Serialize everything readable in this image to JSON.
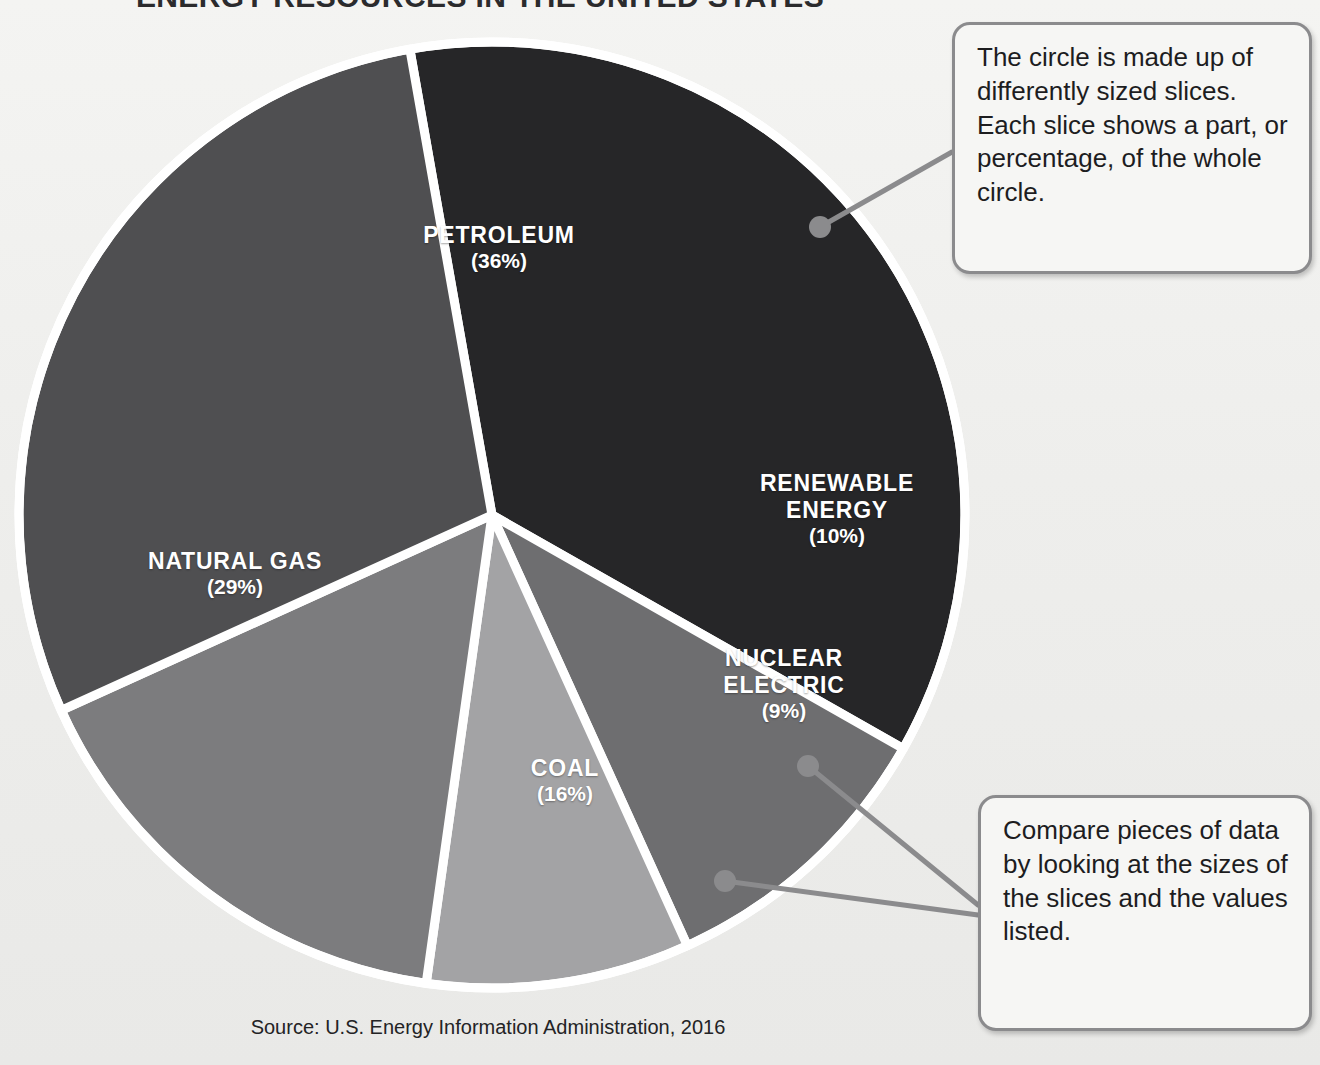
{
  "chart_data": {
    "type": "pie",
    "title": "ENERGY RESOURCES IN THE UNITED STATES",
    "source": "Source: U.S. Energy Information Administration, 2016",
    "unit": "%",
    "categories": [
      "Petroleum",
      "Natural Gas",
      "Coal",
      "Renewable Energy",
      "Nuclear Electric"
    ],
    "values": [
      36,
      29,
      16,
      10,
      9
    ],
    "total": 100,
    "legend": "none",
    "slices": [
      {
        "name": "PETROLEUM",
        "value": 36,
        "percent_label": "(36%)",
        "color": "#262628",
        "start_deg": -10,
        "sweep_deg": 129.6,
        "label_x": 374,
        "label_y": 222,
        "label_w": 250
      },
      {
        "name": "RENEWABLE\nENERGY",
        "line1": "RENEWABLE",
        "line2": "ENERGY",
        "value": 10,
        "percent_label": "(10%)",
        "color": "#6e6e70",
        "start_deg": 119.6,
        "sweep_deg": 36,
        "label_x": 722,
        "label_y": 470,
        "label_w": 230
      },
      {
        "name": "NUCLEAR\nELECTRIC",
        "line1": "NUCLEAR",
        "line2": "ELECTRIC",
        "value": 9,
        "percent_label": "(9%)",
        "color": "#a3a3a5",
        "start_deg": 155.6,
        "sweep_deg": 32.4,
        "label_x": 678,
        "label_y": 645,
        "label_w": 212
      },
      {
        "name": "COAL",
        "value": 16,
        "percent_label": "(16%)",
        "color": "#7c7c7e",
        "start_deg": 188,
        "sweep_deg": 57.6,
        "label_x": 452,
        "label_y": 755,
        "label_w": 226
      },
      {
        "name": "NATURAL GAS",
        "value": 29,
        "percent_label": "(29%)",
        "color": "#4f4f51",
        "start_deg": 245.6,
        "sweep_deg": 104.4,
        "label_x": 110,
        "label_y": 548,
        "label_w": 250
      }
    ],
    "geometry": {
      "center_x": 492,
      "center_y": 515,
      "radius": 473,
      "separator_color": "#ffffff",
      "separator_width": 9
    }
  },
  "callouts": [
    {
      "id": "callout-1",
      "text": "The circle is made up of differently sized slices. Each slice shows a part, or percentage, of the whole circle.",
      "anchor_x": 820,
      "anchor_y": 227
    },
    {
      "id": "callout-2",
      "text": "Compare pieces of data by looking at the sizes of the slices and the values listed.",
      "anchor_a_x": 808,
      "anchor_a_y": 766,
      "anchor_b_x": 725,
      "anchor_b_y": 881
    }
  ],
  "style": {
    "leader_color": "#8b8b8d",
    "callout_border": "#8b8b8d",
    "callout_bg": "#f6f6f4",
    "page_bg": "#f1f1ef",
    "text_color": "#1d1d1f",
    "slice_text_color": "#ffffff"
  }
}
